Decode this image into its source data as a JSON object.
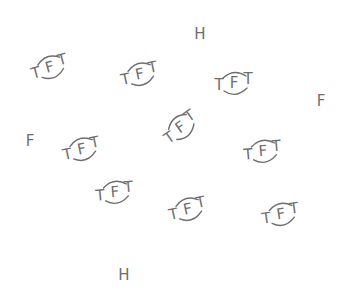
{
  "diagram": {
    "width": 341,
    "height": 292,
    "ink_color": "#6e6e6e",
    "background": "#ffffff",
    "molecules": [
      {
        "label_left": "T",
        "label_center": "F",
        "label_right": "T",
        "x": 50,
        "y": 68,
        "rotation": -15
      },
      {
        "label_left": "T",
        "label_center": "F",
        "label_right": "T",
        "x": 140,
        "y": 75,
        "rotation": -12
      },
      {
        "label_left": "T",
        "label_center": "F",
        "label_right": "T",
        "x": 234,
        "y": 84,
        "rotation": 0
      },
      {
        "label_left": "T",
        "label_center": "F",
        "label_right": "T",
        "x": 181,
        "y": 128,
        "rotation": -35
      },
      {
        "label_left": "T",
        "label_center": "F",
        "label_right": "T",
        "x": 82,
        "y": 150,
        "rotation": -12
      },
      {
        "label_left": "T",
        "label_center": "F",
        "label_right": "T",
        "x": 263,
        "y": 152,
        "rotation": -5
      },
      {
        "label_left": "T",
        "label_center": "F",
        "label_right": "T",
        "x": 115,
        "y": 193,
        "rotation": -5
      },
      {
        "label_left": "T",
        "label_center": "F",
        "label_right": "T",
        "x": 188,
        "y": 210,
        "rotation": -12
      },
      {
        "label_left": "T",
        "label_center": "F",
        "label_right": "T",
        "x": 281,
        "y": 215,
        "rotation": -8
      }
    ],
    "atoms": [
      {
        "symbol": "H",
        "x": 200,
        "y": 34
      },
      {
        "symbol": "F",
        "x": 321,
        "y": 101
      },
      {
        "symbol": "F",
        "x": 30,
        "y": 141
      },
      {
        "symbol": "H",
        "x": 124,
        "y": 275
      }
    ]
  }
}
